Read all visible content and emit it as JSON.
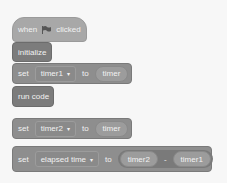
{
  "script": {
    "hat": {
      "before": "when",
      "icon": "green-flag-icon",
      "after": "clicked"
    },
    "initialize": {
      "label": "initialize"
    },
    "set1": {
      "kw": "set",
      "var": "timer1",
      "to": "to",
      "value": "timer"
    },
    "run": {
      "label": "run code"
    },
    "set2": {
      "kw": "set",
      "var": "timer2",
      "to": "to",
      "value": "timer"
    },
    "set3": {
      "kw": "set",
      "var": "elapsed time",
      "to": "to",
      "left": "timer2",
      "op": "-",
      "right": "timer1"
    },
    "caret": "▾"
  }
}
